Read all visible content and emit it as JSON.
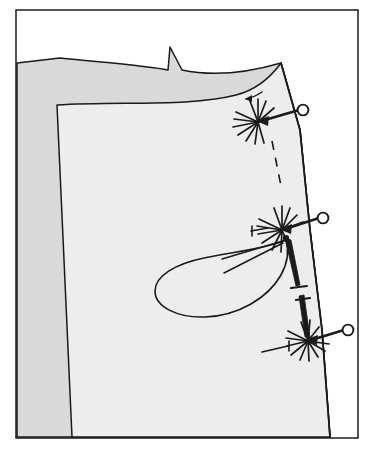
{
  "figure": {
    "title": "Pinning the side seam",
    "caption": "Two fabric layers pinned along the slanted right-hand seam edge",
    "background_color": "#ffffff",
    "ink_color": "#1a1a1a",
    "frame": {
      "name": "illustration-border",
      "stroke": "#2b2b2b",
      "stroke_width": 1.6,
      "x": 16,
      "y": 10,
      "width": 342,
      "height": 428
    },
    "fabric_layers": [
      {
        "name": "back-fabric-layer",
        "label": "Back layer (under layer)",
        "fill": "#d9d9d9",
        "stroke": "#1a1a1a",
        "stroke_width": 1.4
      },
      {
        "name": "front-fabric-layer",
        "label": "Front layer (upper layer)",
        "fill": "#ededed",
        "stroke": "#1a1a1a",
        "stroke_width": 1.4
      }
    ],
    "notch": {
      "name": "seam-notch-point",
      "label": "Notch / point at upper edge",
      "apex_x": 170,
      "apex_y": 47
    },
    "pins": [
      {
        "name": "pin-top",
        "label": "Pin 1 (upper)",
        "head_x": 303,
        "head_y": 110,
        "head_r": 5.4,
        "point_x": 258,
        "point_y": 122,
        "burst_rays": 11,
        "burst_radius": 22
      },
      {
        "name": "pin-middle",
        "label": "Pin 2 (middle)",
        "head_x": 323,
        "head_y": 218,
        "head_r": 5.4,
        "point_x": 282,
        "point_y": 230,
        "burst_rays": 12,
        "burst_radius": 23
      },
      {
        "name": "pin-bottom",
        "label": "Pin 3 (lower)",
        "head_x": 348,
        "head_y": 330,
        "head_r": 5.4,
        "point_x": 308,
        "point_y": 341,
        "burst_rays": 12,
        "burst_radius": 20
      }
    ],
    "basting_line": {
      "name": "dashed-stitch-line",
      "label": "Dashed stitching / seam line",
      "dash_pattern": "9 8",
      "stroke_width": 1.6
    },
    "needles": [
      {
        "name": "needle-upper",
        "label": "Needle / dart leg (upper)",
        "tip_x": 286,
        "tip_y": 239,
        "eye_x": 298,
        "eye_y": 288
      },
      {
        "name": "needle-lower",
        "label": "Needle / dart leg (lower)",
        "tip_x": 310,
        "tip_y": 338,
        "eye_x": 303,
        "eye_y": 289
      }
    ],
    "thread_loop": {
      "name": "thread-loop",
      "label": "Loop of thread pulled from the pin point",
      "anchor_x": 286,
      "anchor_y": 239
    },
    "pointer_arrows": [
      {
        "name": "arrow-top-pin",
        "label": "Direction arrow at upper pin"
      },
      {
        "name": "arrow-middle-pin",
        "label": "Direction arrow at middle pin"
      },
      {
        "name": "arrow-bottom-pin",
        "label": "Direction arrow at lower pin"
      },
      {
        "name": "arrow-seam-edge",
        "label": "Direction arrow at seam edge"
      }
    ]
  }
}
